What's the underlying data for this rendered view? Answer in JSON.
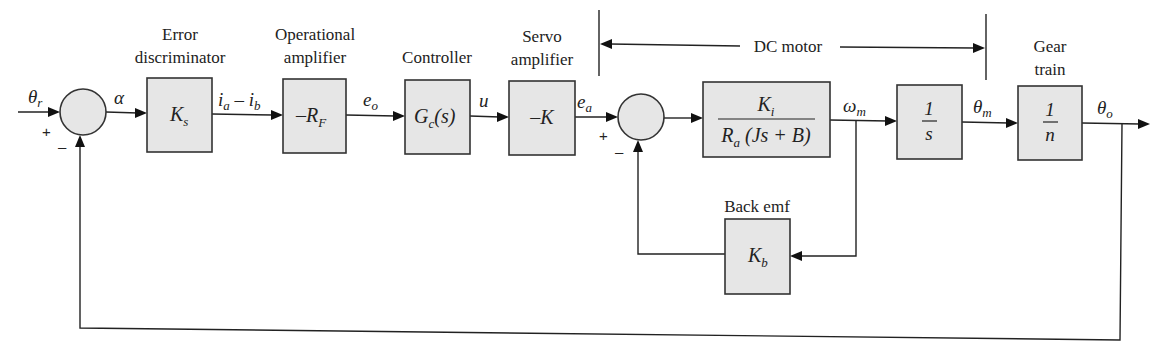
{
  "diagram": {
    "type": "block-diagram",
    "colors": {
      "block_fill": "#e6e6e6",
      "stroke": "#333333",
      "background": "#ffffff"
    },
    "captions": {
      "error_discriminator": [
        "Error",
        "discriminator"
      ],
      "operational_amplifier": [
        "Operational",
        "amplifier"
      ],
      "controller": "Controller",
      "servo_amplifier": [
        "Servo",
        "amplifier"
      ],
      "dc_motor": "DC motor",
      "gear_train": [
        "Gear",
        "train"
      ],
      "back_emf": "Back emf"
    },
    "blocks": {
      "ks": {
        "main": "K",
        "sub": "s"
      },
      "rf": {
        "prefix": "–",
        "main": "R",
        "sub": "F"
      },
      "gc": {
        "main": "G",
        "sub": "c",
        "suffix": "(s)"
      },
      "k": {
        "text": "–K"
      },
      "motor": {
        "numerator_main": "K",
        "numerator_sub": "i",
        "denominator_main": "R",
        "denominator_sub": "a",
        "denominator_rest": " (Js + B)"
      },
      "integrator": {
        "numerator": "1",
        "denominator": "s"
      },
      "gear": {
        "numerator": "1",
        "denominator": "n"
      },
      "kb": {
        "main": "K",
        "sub": "b"
      }
    },
    "signals": {
      "theta_r": {
        "main": "θ",
        "sub": "r"
      },
      "alpha": "α",
      "ia_ib": {
        "a_main": "i",
        "a_sub": "a",
        "minus": " – ",
        "b_main": "i",
        "b_sub": "b"
      },
      "e_o": {
        "main": "e",
        "sub": "o"
      },
      "u": "u",
      "e_a": {
        "main": "e",
        "sub": "a"
      },
      "omega_m": {
        "main": "ω",
        "sub": "m"
      },
      "theta_m": {
        "main": "θ",
        "sub": "m"
      },
      "theta_o": {
        "main": "θ",
        "sub": "o"
      }
    },
    "summers": {
      "s1": {
        "plus": "+",
        "minus": "–"
      },
      "s2": {
        "plus": "+",
        "minus": "–"
      }
    }
  }
}
